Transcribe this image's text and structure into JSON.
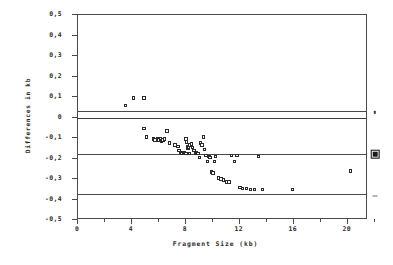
{
  "chart_data": {
    "type": "scatter",
    "title": "",
    "xlabel": "Fragment Size (kb)",
    "ylabel": "Differences in kb",
    "xlim": [
      0,
      21.5
    ],
    "ylim": [
      -0.5,
      0.5
    ],
    "xticks": [
      0,
      4,
      8,
      12,
      16,
      20
    ],
    "xticklabels": [
      "0",
      "4",
      "8",
      "12",
      "16",
      "20"
    ],
    "yticks": [
      0.5,
      0.4,
      0.3,
      0.2,
      0.1,
      0,
      -0.1,
      -0.2,
      -0.3,
      -0.4,
      -0.5
    ],
    "yticklabels": [
      "0,5",
      "0,4",
      "0,3",
      "0,2",
      "0,1",
      "0",
      "-0,1",
      "-0,2",
      "-0,3",
      "-0,4",
      "-0,5"
    ],
    "decimal_separator": ",",
    "grid": false,
    "legend": "none",
    "marker": "open-square",
    "reference_lines": [
      {
        "name": "upper-limit-of-agreement",
        "value": 0.03,
        "style": "solid"
      },
      {
        "name": "zero-line",
        "value": 0.0,
        "style": "solid"
      },
      {
        "name": "mean-difference",
        "value": -0.18,
        "style": "solid"
      },
      {
        "name": "lower-limit-of-agreement",
        "value": -0.375,
        "style": "solid"
      }
    ],
    "edge_markers": [
      {
        "name": "upper-limit-marker",
        "value": 0.02,
        "glyph": "sq-small"
      },
      {
        "name": "mean-marker",
        "value": -0.185,
        "glyph": "sq-big"
      },
      {
        "name": "lower-limit-marker",
        "value": -0.39,
        "glyph": "dash"
      }
    ],
    "x": [
      3.5,
      4.1,
      4.9,
      4.9,
      5.1,
      5.6,
      5.7,
      5.9,
      6.0,
      6.1,
      6.2,
      6.3,
      6.4,
      6.6,
      6.8,
      7.2,
      7.4,
      7.5,
      7.6,
      7.7,
      7.8,
      7.85,
      7.9,
      7.95,
      8.0,
      8.0,
      8.05,
      8.1,
      8.15,
      8.2,
      8.25,
      8.3,
      8.4,
      8.5,
      8.6,
      8.7,
      8.8,
      8.9,
      9.0,
      9.1,
      9.2,
      9.3,
      9.4,
      9.5,
      9.6,
      9.7,
      9.8,
      9.9,
      10.0,
      10.1,
      10.2,
      10.4,
      10.6,
      10.8,
      11.0,
      11.2,
      11.4,
      11.6,
      11.8,
      12.0,
      12.2,
      12.5,
      12.8,
      13.1,
      13.4,
      13.7,
      15.9,
      20.2
    ],
    "y": [
      0.06,
      0.095,
      0.095,
      -0.055,
      -0.095,
      -0.105,
      -0.11,
      -0.105,
      -0.11,
      -0.105,
      -0.115,
      -0.11,
      -0.105,
      -0.065,
      -0.125,
      -0.135,
      -0.14,
      -0.16,
      -0.17,
      -0.175,
      -0.175,
      -0.17,
      -0.175,
      -0.175,
      -0.175,
      -0.105,
      -0.12,
      -0.14,
      -0.15,
      -0.145,
      -0.175,
      -0.135,
      -0.13,
      -0.145,
      -0.16,
      -0.175,
      -0.17,
      -0.175,
      -0.195,
      -0.125,
      -0.135,
      -0.095,
      -0.155,
      -0.185,
      -0.215,
      -0.19,
      -0.195,
      -0.265,
      -0.27,
      -0.215,
      -0.19,
      -0.295,
      -0.3,
      -0.305,
      -0.315,
      -0.315,
      -0.185,
      -0.215,
      -0.185,
      -0.34,
      -0.345,
      -0.345,
      -0.35,
      -0.35,
      -0.19,
      -0.35,
      -0.35,
      -0.26
    ]
  }
}
